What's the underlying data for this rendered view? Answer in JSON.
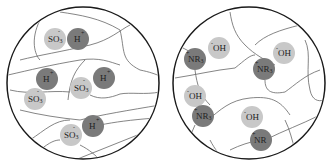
{
  "diagram": {
    "colors": {
      "background": "#ffffff",
      "boundary": "#1a1a1a",
      "polymer_chain": "#555555",
      "fixed_ion_light": "#c8c8c8",
      "mobile_ion_dark": "#7a7a7a",
      "text": "#222222"
    },
    "panels": [
      {
        "name": "cation-exchange-membrane",
        "circle": {
          "cx": 83,
          "cy": 83,
          "r": 76
        },
        "ions": [
          {
            "type": "fixed",
            "label": "SO",
            "sub": "3",
            "sup": "-",
            "x": 55,
            "y": 39,
            "r": 11
          },
          {
            "type": "mobile",
            "label": "H",
            "sub": "",
            "sup": "+",
            "x": 78,
            "y": 39,
            "r": 11
          },
          {
            "type": "mobile",
            "label": "H",
            "sub": "",
            "sup": "+",
            "x": 47,
            "y": 79,
            "r": 11
          },
          {
            "type": "fixed",
            "label": "SO",
            "sub": "3",
            "sup": "-",
            "x": 81,
            "y": 88,
            "r": 11
          },
          {
            "type": "mobile",
            "label": "H",
            "sub": "",
            "sup": "+",
            "x": 104,
            "y": 78,
            "r": 11
          },
          {
            "type": "fixed",
            "label": "SO",
            "sub": "3",
            "sup": "-",
            "x": 35,
            "y": 99,
            "r": 11
          },
          {
            "type": "fixed",
            "label": "SO",
            "sub": "3",
            "sup": "-",
            "x": 71,
            "y": 135,
            "r": 11
          },
          {
            "type": "mobile",
            "label": "H",
            "sub": "",
            "sup": "+",
            "x": 93,
            "y": 126,
            "r": 11
          }
        ]
      },
      {
        "name": "anion-exchange-membrane",
        "circle": {
          "cx": 249,
          "cy": 83,
          "r": 76
        },
        "ions": [
          {
            "type": "fixed-light",
            "label": "OH",
            "sub": "",
            "pre": "-",
            "x": 219,
            "y": 48,
            "r": 11
          },
          {
            "type": "dark",
            "label": "NR",
            "sub": "3",
            "pre": "+",
            "x": 195,
            "y": 59,
            "r": 11
          },
          {
            "type": "fixed-light",
            "label": "OH",
            "sub": "",
            "pre": "-",
            "x": 284,
            "y": 53,
            "r": 11
          },
          {
            "type": "dark",
            "label": "NR",
            "sub": "3",
            "pre": "+",
            "x": 264,
            "y": 69,
            "r": 11
          },
          {
            "type": "fixed-light",
            "label": "OH",
            "sub": "",
            "pre": "-",
            "x": 195,
            "y": 96,
            "r": 11
          },
          {
            "type": "dark",
            "label": "NR",
            "sub": "3",
            "pre": "+",
            "x": 203,
            "y": 116,
            "r": 11
          },
          {
            "type": "fixed-light",
            "label": "OH",
            "sub": "",
            "pre": "-",
            "x": 252,
            "y": 117,
            "r": 11
          },
          {
            "type": "dark",
            "label": "NR",
            "sub": "",
            "pre": "+",
            "x": 261,
            "y": 140,
            "r": 11
          }
        ]
      }
    ]
  }
}
